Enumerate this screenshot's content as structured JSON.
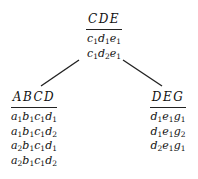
{
  "tree": {
    "root": {
      "header": "CDE",
      "rows": [
        "c1d1e1",
        "c1d2e1"
      ]
    },
    "left": {
      "header": "ABCD",
      "rows": [
        "a1b1c1d1",
        "a1b1c1d2",
        "a2b1c1d1",
        "a2b1c1d2"
      ]
    },
    "right": {
      "header": "DEG",
      "rows": [
        "d1e1g1",
        "d1e1g2",
        "d2e1g1"
      ]
    },
    "edges": [
      {
        "from": "root",
        "to": "left"
      },
      {
        "from": "root",
        "to": "right"
      }
    ]
  }
}
